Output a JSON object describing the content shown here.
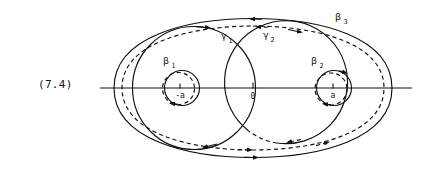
{
  "figure": {
    "equation_label": "(7.4)",
    "colors": {
      "ink": "#111111",
      "background": "#ffffff"
    },
    "axis": {
      "name": "real-axis",
      "y": 88,
      "x_start": 100,
      "x_end": 412
    },
    "points": [
      {
        "id": "minus-a",
        "label": "-a",
        "x": 180,
        "y": 88,
        "label_x": 180,
        "label_y": 98
      },
      {
        "id": "origin",
        "label": "0",
        "x": 253,
        "y": 88,
        "label_x": 253,
        "label_y": 99
      },
      {
        "id": "plus-a",
        "label": "a",
        "x": 333,
        "y": 88,
        "label_x": 333,
        "label_y": 98
      }
    ],
    "curve_labels": [
      {
        "id": "beta-1",
        "base": "β",
        "sub": "1",
        "x": 168,
        "y": 62
      },
      {
        "id": "beta-2",
        "base": "β",
        "sub": "2",
        "x": 316,
        "y": 62
      },
      {
        "id": "beta-3",
        "base": "β",
        "sub": "3",
        "x": 340,
        "y": 19
      },
      {
        "id": "gamma-1",
        "base": "γ",
        "sub": "1",
        "x": 226,
        "y": 38
      },
      {
        "id": "gamma-2",
        "base": "γ",
        "sub": "2",
        "x": 268,
        "y": 37
      }
    ],
    "curves": [
      {
        "id": "beta-3-outer-solid",
        "style": "solid",
        "shape": "outer-ellipse"
      },
      {
        "id": "beta-3-outer-dashed",
        "style": "dashed",
        "shape": "outer-ellipse-inner"
      },
      {
        "id": "gamma-1-circle",
        "style": "solid",
        "shape": "large-left-circle"
      },
      {
        "id": "gamma-2-circle",
        "style": "mixed",
        "shape": "large-right-circle"
      },
      {
        "id": "beta-1-circle",
        "style": "solid",
        "shape": "small-left-circle"
      },
      {
        "id": "beta-1-circle-dash",
        "style": "dashed",
        "shape": "small-left-circle-offset"
      },
      {
        "id": "beta-2-circle",
        "style": "solid",
        "shape": "small-right-circle"
      },
      {
        "id": "beta-2-circle-dash",
        "style": "dashed",
        "shape": "small-right-circle-offset"
      }
    ],
    "arrow_count": 12
  }
}
